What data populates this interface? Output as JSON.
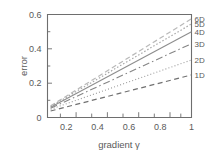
{
  "chart_data": {
    "type": "line",
    "title": "",
    "xlabel": "gradient γ",
    "ylabel": "error",
    "xlim": [
      0.08,
      1.0
    ],
    "ylim": [
      0.0,
      0.6
    ],
    "xticks": [
      "0.2",
      "0.4",
      "0.6",
      "0.8",
      "1"
    ],
    "xtick_values": [
      0.2,
      0.4,
      0.6,
      0.8,
      1.0
    ],
    "yticks": [
      "0",
      "0.2",
      "0.4",
      "0.6"
    ],
    "ytick_values": [
      0.0,
      0.2,
      0.4,
      0.6
    ],
    "grid": false,
    "legend_position": "right-outside-inline-labels",
    "x": [
      0.1,
      1.0
    ],
    "series": [
      {
        "name": "6D",
        "label": "6D",
        "values": [
          0.068,
          0.575
        ],
        "color": "#b9b9b9",
        "dash": "5,3",
        "width": 1.2
      },
      {
        "name": "5D",
        "label": "5D",
        "values": [
          0.064,
          0.545
        ],
        "color": "#a8a8a8",
        "dash": "1.5,2",
        "width": 1.2
      },
      {
        "name": "4D",
        "label": "4D",
        "values": [
          0.06,
          0.5
        ],
        "color": "#8d8d8d",
        "dash": "none",
        "width": 1.1
      },
      {
        "name": "3D",
        "label": "3D",
        "values": [
          0.054,
          0.43
        ],
        "color": "#858585",
        "dash": "7,3,1.5,3",
        "width": 1.1
      },
      {
        "name": "2D",
        "label": "2D",
        "values": [
          0.048,
          0.335
        ],
        "color": "#9a9a9a",
        "dash": "1,2.2",
        "width": 1.1
      },
      {
        "name": "1D",
        "label": "1D",
        "values": [
          0.038,
          0.248
        ],
        "color": "#707070",
        "dash": "5,3.5",
        "width": 1.2
      }
    ]
  },
  "axes": {
    "y_axis_title": "error",
    "x_axis_title": "gradient γ"
  }
}
